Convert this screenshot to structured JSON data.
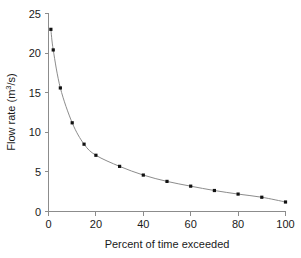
{
  "chart_data": {
    "type": "line",
    "title": "",
    "subtitle": "",
    "xlabel": "Percent of time exceeded",
    "ylabel_text": "Flow rate (m",
    "ylabel_sup": "3",
    "ylabel_tail": "/s)",
    "ylabel_full": "Flow rate (m3/s)",
    "x": [
      1,
      2,
      5,
      10,
      15,
      20,
      30,
      40,
      50,
      60,
      70,
      80,
      90,
      100
    ],
    "values": [
      23.0,
      20.4,
      15.6,
      11.2,
      8.5,
      7.1,
      5.7,
      4.6,
      3.8,
      3.2,
      2.65,
      2.2,
      1.8,
      1.2
    ],
    "series": [
      {
        "name": "Flow duration curve",
        "values": [
          23.0,
          20.4,
          15.6,
          11.2,
          8.5,
          7.1,
          5.7,
          4.6,
          3.8,
          3.2,
          2.65,
          2.2,
          1.8,
          1.2
        ]
      }
    ],
    "xlim": [
      0,
      100
    ],
    "ylim": [
      0,
      25
    ],
    "xticks": [
      0,
      20,
      40,
      60,
      80,
      100
    ],
    "yticks": [
      0,
      5,
      10,
      15,
      20,
      25
    ],
    "xtick_labels": [
      "0",
      "20",
      "40",
      "60",
      "80",
      "100"
    ],
    "ytick_labels": [
      "0",
      "5",
      "10",
      "15",
      "20",
      "25"
    ],
    "grid": false,
    "legend": "none",
    "marker": "square",
    "line_color": "#8c8c8c",
    "marker_color": "#111111",
    "axis_color": "#8c8c8c",
    "background_color": "#ffffff"
  }
}
